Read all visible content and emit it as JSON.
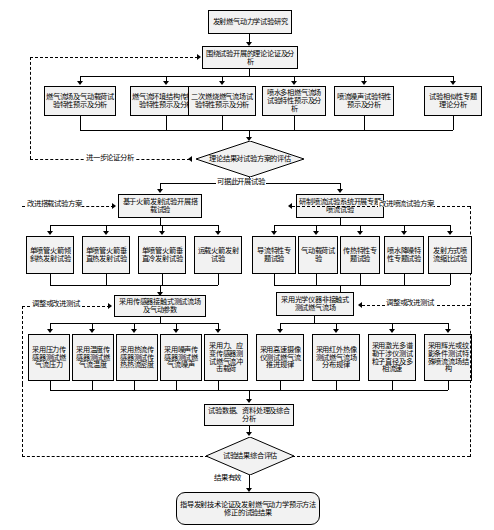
{
  "diagram": {
    "title": "发射燃气动力学试验研究",
    "type": "flowchart"
  },
  "nodes": {
    "root": "发射燃气动力学试验研究",
    "theory": "围绕试验开展的理论论证及分析",
    "theory_children": [
      "燃气流场及气动载荷试验特性预示及分析",
      "燃气流环境结构传热试验特性预示及分析",
      "二次燃烧燃气流场试验特性预示及分析",
      "喷水多相燃气流场试验特性预示及分析",
      "喷流噪声试验特性预示及分析",
      "试验相似性专题理论分析"
    ],
    "decision1": "理论结果对试验方案的评估",
    "branch_left": "基于火箭发射试验开展搭载试验",
    "branch_right": "研制喷流试验系统开展专题喷流试验",
    "left_tests": [
      "单喷管火箭倾斜热发射试验",
      "单喷管火箭垂直热发射试验",
      "单喷管火箭垂直冷发射试验",
      "运载火箭发射试验"
    ],
    "right_tests": [
      "导流特性专题试验",
      "气动载荷试验",
      "传热特性专题试验",
      "喷水降噪特性专题试验",
      "发射方式喷流缩比试验"
    ],
    "method_contact": "采用传感器接触式测试流场及气动参数",
    "method_optical": "采用光学仪器非接触式测试燃气流场",
    "contact_measures": [
      "采用压力传感器测试燃气流压力",
      "采用温度传感器测试燃气流温度",
      "采用热流传感器测试传热热流密度",
      "采用噪声传感器测试燃气流噪声",
      "采用力、应变传感器测试燃气流冲击载荷"
    ],
    "optical_measures": [
      "采用高速摄像仪测试燃气流推进规律",
      "采用红外热像测试燃气流场分布规律",
      "采用激光多谱勒干涉仪测试粒子直径及多相流速",
      "采用辉光或纹影条件测试特殊喷流流场结构"
    ],
    "data_analysis": "试验数据、资料处理及综合分析",
    "decision2": "试验结果综合评估",
    "final": "指导发射技术论证及发射燃气动力学预示方法修正的试验结果"
  },
  "edge_labels": {
    "further_analysis": "进一步论证分析",
    "can_proceed": "可据此开展试验",
    "improve_carrier": "改进搭载试验方案",
    "improve_jet": "改进喷流试验方案",
    "adjust_test_left": "调整或改进测试",
    "adjust_test_right": "调整或改进测试",
    "result_valid": "结果有效"
  },
  "colors": {
    "node_fill": "#f2f2f2",
    "stroke": "#000000",
    "background": "#ffffff"
  }
}
